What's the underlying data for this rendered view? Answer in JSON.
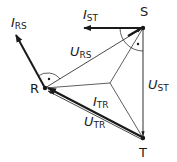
{
  "diagram": {
    "type": "phasor-diagram",
    "nodes": {
      "S": {
        "label": "S",
        "x": 143,
        "y": 28
      },
      "R": {
        "label": "R",
        "x": 45,
        "y": 88
      },
      "T": {
        "label": "T",
        "x": 143,
        "y": 138
      },
      "center": {
        "x": 110,
        "y": 83
      }
    },
    "voltages": {
      "U_RS": {
        "main": "U",
        "sub": "RS"
      },
      "U_ST": {
        "main": "U",
        "sub": "ST"
      },
      "U_TR": {
        "main": "U",
        "sub": "TR"
      }
    },
    "currents": {
      "I_RS": {
        "main": "I",
        "sub": "RS"
      },
      "I_ST": {
        "main": "I",
        "sub": "ST"
      },
      "I_TR": {
        "main": "I",
        "sub": "TR"
      }
    },
    "colors": {
      "line": "#1a1a1a",
      "background": "#ffffff"
    }
  }
}
